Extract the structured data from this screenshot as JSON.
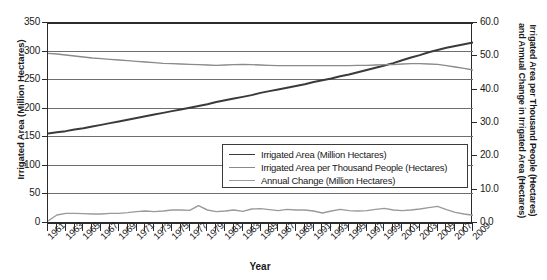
{
  "chart_data": {
    "type": "line",
    "title": "",
    "xlabel": "Year",
    "ylabel": "Irrigated Area (Million Hectares)",
    "ylabel_right_line1": "Irrigated Area per Thousand People (Hectares)",
    "ylabel_right_line2": "and Annual Change in Irrigated Area (Hectares)",
    "grid": true,
    "legend_position": "center-right-inside",
    "ylim": [
      0,
      350
    ],
    "ylim_right": [
      0,
      60
    ],
    "yticks": [
      "0",
      "50",
      "100",
      "150",
      "200",
      "250",
      "300",
      "350"
    ],
    "yticks_right": [
      "0.0",
      "10.0",
      "20.0",
      "30.0",
      "40.0",
      "50.0",
      "60.0"
    ],
    "x": [
      1961,
      1962,
      1963,
      1964,
      1965,
      1966,
      1967,
      1968,
      1969,
      1970,
      1971,
      1972,
      1973,
      1974,
      1975,
      1976,
      1977,
      1978,
      1979,
      1980,
      1981,
      1982,
      1983,
      1984,
      1985,
      1986,
      1987,
      1988,
      1989,
      1990,
      1991,
      1992,
      1993,
      1994,
      1995,
      1996,
      1997,
      1998,
      1999,
      2000,
      2001,
      2002,
      2003,
      2004,
      2005,
      2006,
      2007,
      2008,
      2009
    ],
    "xtick_labels": [
      "1961",
      "1963",
      "1965",
      "1967",
      "1969",
      "1971",
      "1973",
      "1975",
      "1977",
      "1979",
      "1981",
      "1983",
      "1985",
      "1987",
      "1989",
      "1991",
      "1993",
      "1995",
      "1997",
      "1999",
      "2001",
      "2003",
      "2005",
      "2007",
      "2009"
    ],
    "series": [
      {
        "name": "Irrigated Area (Million Hectares)",
        "axis": "left",
        "color": "#3a3a3a",
        "width": 2.0,
        "values": [
          155,
          157,
          159,
          162,
          164,
          167,
          170,
          173,
          176,
          179,
          182,
          185,
          188,
          191,
          194,
          197,
          200,
          203,
          206,
          210,
          213,
          216,
          219,
          222,
          226,
          229,
          232,
          235,
          238,
          241,
          245,
          248,
          251,
          255,
          258,
          262,
          266,
          270,
          274,
          278,
          283,
          288,
          292,
          297,
          301,
          305,
          308,
          311,
          314
        ]
      },
      {
        "name": "Irrigated Area per Thousand People (Hectares)",
        "axis": "right",
        "color": "#8a8a8a",
        "width": 1.4,
        "values": [
          50.6,
          50.4,
          50.1,
          49.8,
          49.5,
          49.2,
          49.0,
          48.8,
          48.6,
          48.4,
          48.2,
          48.0,
          47.8,
          47.6,
          47.5,
          47.4,
          47.3,
          47.2,
          47.1,
          47.0,
          47.1,
          47.2,
          47.3,
          47.2,
          47.1,
          47.0,
          46.9,
          46.9,
          46.9,
          46.9,
          46.9,
          46.9,
          46.9,
          46.9,
          46.9,
          47.0,
          47.0,
          47.1,
          47.2,
          47.2,
          47.4,
          47.5,
          47.5,
          47.4,
          47.3,
          46.9,
          46.5,
          46.1,
          45.6
        ]
      },
      {
        "name": "Annual Change (Million Hectares)",
        "axis": "right",
        "color": "#9a9a9a",
        "width": 1.4,
        "values": [
          0.3,
          2.1,
          2.6,
          2.6,
          2.5,
          2.4,
          2.4,
          2.6,
          2.6,
          2.8,
          3.1,
          3.3,
          3.1,
          3.3,
          3.6,
          3.6,
          3.5,
          4.9,
          3.6,
          3.1,
          3.3,
          3.6,
          3.2,
          3.9,
          4.0,
          3.7,
          3.4,
          3.8,
          3.6,
          3.6,
          3.3,
          2.7,
          3.3,
          3.8,
          3.4,
          3.3,
          3.4,
          3.8,
          4.1,
          3.6,
          3.4,
          3.6,
          3.9,
          4.3,
          4.7,
          3.7,
          2.9,
          2.4,
          2.0
        ]
      }
    ]
  },
  "legend": {
    "items": [
      {
        "label": "Irrigated Area (Million Hectares)",
        "color": "#3a3a3a"
      },
      {
        "label": "Irrigated Area per Thousand People (Hectares)",
        "color": "#8a8a8a"
      },
      {
        "label": "Annual Change (Million Hectares)",
        "color": "#9a9a9a"
      }
    ]
  }
}
